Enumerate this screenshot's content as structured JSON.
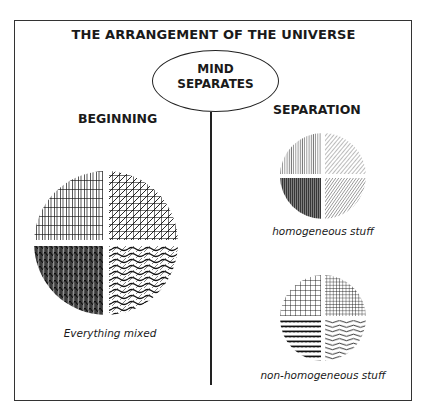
{
  "title": "THE ARRANGEMENT OF THE UNIVERSE",
  "center_node": {
    "line1": "MIND",
    "line2": "SEPARATES"
  },
  "left": {
    "heading": "BEGINNING",
    "caption": "Everything mixed",
    "circle": {
      "quadrants": [
        "grid-vertical-hatch",
        "diagonal-crosshatch",
        "dense-zigzag",
        "wavy-diagonal-hatch"
      ]
    }
  },
  "right": {
    "heading": "SEPARATION",
    "groups": [
      {
        "caption": "homogeneous stuff",
        "quadrants": [
          "vertical-lines",
          "diagonal-lines",
          "dark-vertical-lines",
          "diagonal-lines-dense"
        ]
      },
      {
        "caption": "non-homogeneous stuff",
        "quadrants": [
          "grid",
          "fine-grid",
          "zigzag-rows",
          "wavy-lines"
        ]
      }
    ]
  },
  "colors": {
    "ink": "#1a1a1a",
    "background": "#ffffff"
  }
}
